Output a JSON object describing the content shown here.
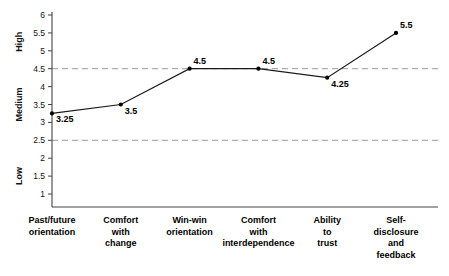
{
  "chart_data": {
    "type": "line",
    "title": "",
    "subtitle": "",
    "xlabel": "",
    "ylabel": "",
    "categories": [
      "Past/future orientation",
      "Comfort with change",
      "Win-win orientation",
      "Comfort with interdependence",
      "Ability to trust",
      "Self-disclosure and feedback"
    ],
    "category_lines": [
      [
        "Past/future",
        "orientation"
      ],
      [
        "Comfort",
        "with",
        "change"
      ],
      [
        "Win-win",
        "orientation"
      ],
      [
        "Comfort",
        "with",
        "interdependence"
      ],
      [
        "Ability",
        "to",
        "trust"
      ],
      [
        "Self-",
        "disclosure",
        "and",
        "feedback"
      ]
    ],
    "values": [
      3.25,
      3.5,
      4.5,
      4.5,
      4.25,
      5.5
    ],
    "point_labels": [
      "3.25",
      "3.5",
      "4.5",
      "4.5",
      "4.25",
      "5.5"
    ],
    "ylim": [
      0.5,
      6.0
    ],
    "y_ticks": [
      6,
      5.5,
      5,
      4.5,
      4,
      3.5,
      3,
      2.5,
      2,
      1.5,
      1
    ],
    "y_tick_labels": [
      "6",
      "5.5",
      "5",
      "4.5",
      "4",
      "3.5",
      "3",
      "2.5",
      "2",
      "1.5",
      "1"
    ],
    "band_labels": [
      {
        "text": "High",
        "center_value": 5.25
      },
      {
        "text": "Medium",
        "center_value": 3.5
      },
      {
        "text": "Low",
        "center_value": 1.5
      }
    ],
    "reference_lines": [
      4.5,
      2.5
    ],
    "grid": false,
    "legend": null,
    "series": [
      {
        "name": "Relationship competency rating",
        "values": [
          3.25,
          3.5,
          4.5,
          4.5,
          4.25,
          5.5
        ]
      }
    ],
    "colors": {
      "line": "#1a1a1a",
      "marker": "#000000",
      "axis": "#444444",
      "reference_line": "#9a9a9a",
      "background": "#ffffff",
      "text": "#000000"
    }
  }
}
